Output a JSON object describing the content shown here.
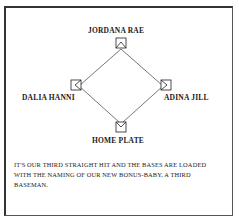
{
  "diagram": {
    "bases": {
      "second": {
        "label": "JORDANA RAE"
      },
      "third": {
        "label": "DALIA HANNI"
      },
      "first": {
        "label": "ADINA JILL"
      },
      "home": {
        "label": "HOME PLATE"
      }
    }
  },
  "announcement": {
    "text": "IT'S OUR THIRD STRAIGHT HIT AND THE BASES ARE LOADED WITH THE NAMING OF OUR NEW BONUS-BABY, A THIRD BASEMAN."
  }
}
